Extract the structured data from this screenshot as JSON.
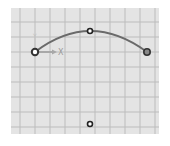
{
  "viewport": {
    "background": "#e4e4e4",
    "grid_color": "#b8b8b8",
    "grid_spacing": 15
  },
  "axis": {
    "x_label": "X",
    "y_label": "Y",
    "origin_icon": "coordinate-axis-icon"
  },
  "arc": {
    "color": "#6a6a6a",
    "start": {
      "x": 35,
      "y": 52
    },
    "mid": {
      "x": 90,
      "y": 31
    },
    "end": {
      "x": 147,
      "y": 52
    }
  },
  "points": [
    {
      "name": "arc-start-point",
      "x": 35,
      "y": 52
    },
    {
      "name": "arc-mid-point",
      "x": 90,
      "y": 31
    },
    {
      "name": "arc-end-point",
      "x": 147,
      "y": 52
    },
    {
      "name": "arc-center-point",
      "x": 90,
      "y": 124
    }
  ]
}
